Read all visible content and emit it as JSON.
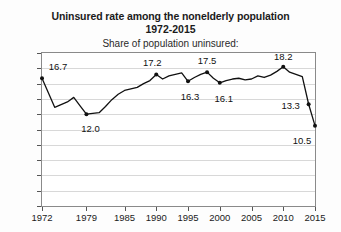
{
  "chart_data": {
    "type": "line",
    "title": "Uninsured rate among the nonelderly population",
    "title_years": "1972-2015",
    "subtitle": "Share of population uninsured:",
    "xlabel": "",
    "ylabel": "",
    "xlim": [
      1972,
      2015
    ],
    "ylim": [
      0,
      20
    ],
    "ytick_step": 2,
    "grid": "horizontal",
    "legend": "none",
    "xticks": [
      1972,
      1979,
      1985,
      1990,
      1995,
      2000,
      2005,
      2010,
      2015
    ],
    "xtick_labels": [
      "1972",
      "1979",
      "1985",
      "1990",
      "1995",
      "2000",
      "2005",
      "2010",
      "2015"
    ],
    "yticks": [
      0,
      2,
      4,
      6,
      8,
      10,
      12,
      14,
      16,
      18,
      20
    ],
    "ytick_labels": [
      "0",
      "2",
      "4",
      "6",
      "8",
      "10",
      "12",
      "14",
      "16",
      "18",
      "20"
    ],
    "x": [
      1972,
      1974,
      1976,
      1977,
      1978,
      1979,
      1980,
      1981,
      1982,
      1983,
      1984,
      1985,
      1986,
      1987,
      1988,
      1989,
      1990,
      1991,
      1992,
      1993,
      1994,
      1995,
      1996,
      1997,
      1998,
      1999,
      2000,
      2001,
      2002,
      2003,
      2004,
      2005,
      2006,
      2007,
      2008,
      2009,
      2010,
      2011,
      2012,
      2013,
      2014,
      2015
    ],
    "values": [
      16.7,
      12.9,
      13.6,
      14.2,
      13.1,
      12.0,
      12.1,
      12.2,
      13.0,
      13.9,
      14.6,
      15.1,
      15.3,
      15.5,
      16.0,
      16.4,
      17.2,
      16.6,
      17.0,
      17.2,
      17.4,
      16.3,
      16.8,
      17.2,
      17.5,
      16.7,
      16.1,
      16.4,
      16.6,
      16.7,
      16.5,
      16.6,
      17.0,
      16.8,
      17.1,
      17.6,
      18.2,
      17.5,
      17.2,
      16.9,
      13.3,
      10.5
    ],
    "labeled_points": [
      {
        "x": 1972,
        "y": 16.7,
        "label": "16.7",
        "label_dx": 16,
        "label_dy": -12
      },
      {
        "x": 1979,
        "y": 12.0,
        "label": "12.0",
        "label_dx": 4,
        "label_dy": 14
      },
      {
        "x": 1990,
        "y": 17.2,
        "label": "17.2",
        "label_dx": -4,
        "label_dy": -12
      },
      {
        "x": 1995,
        "y": 16.3,
        "label": "16.3",
        "label_dx": 2,
        "label_dy": 15
      },
      {
        "x": 1998,
        "y": 17.5,
        "label": "17.5",
        "label_dx": 0,
        "label_dy": -12
      },
      {
        "x": 2000,
        "y": 16.1,
        "label": "16.1",
        "label_dx": 4,
        "label_dy": 15
      },
      {
        "x": 2010,
        "y": 18.2,
        "label": "18.2",
        "label_dx": 0,
        "label_dy": -11
      },
      {
        "x": 2014,
        "y": 13.3,
        "label": "13.3",
        "label_dx": -18,
        "label_dy": 1
      },
      {
        "x": 2015,
        "y": 10.5,
        "label": "10.5",
        "label_dx": -13,
        "label_dy": 14
      }
    ],
    "line_color": "#111111",
    "marker_color": "#111111",
    "grid_color": "#d8d8d8",
    "frame_color": "#8a8a8a",
    "background_color": "#ffffff"
  }
}
